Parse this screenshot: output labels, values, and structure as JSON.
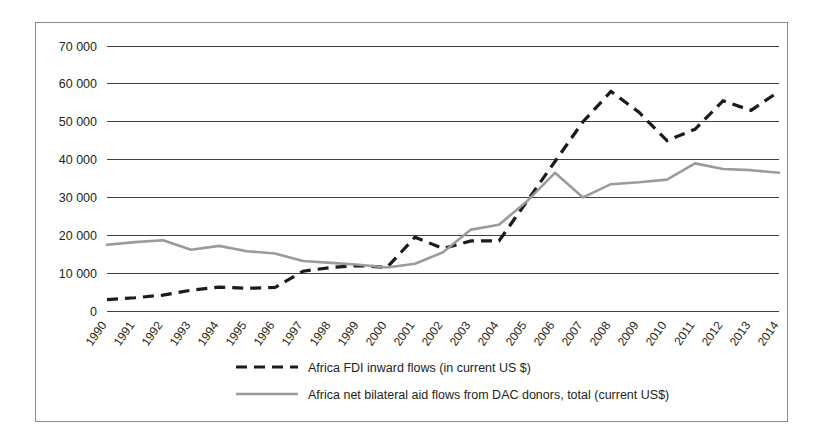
{
  "chart_data": {
    "type": "line",
    "title": "",
    "subtitle": "",
    "xlabel": "",
    "ylabel": "",
    "grid": true,
    "legend_position": "bottom",
    "ylim": [
      0,
      75000
    ],
    "y_ticks": [
      0,
      10000,
      20000,
      30000,
      40000,
      50000,
      60000,
      70000
    ],
    "y_tick_labels": [
      "0",
      "10 000",
      "20 000",
      "30 000",
      "40 000",
      "50 000",
      "60 000",
      "70 000"
    ],
    "categories": [
      "1990",
      "1991",
      "1992",
      "1993",
      "1994",
      "1995",
      "1996",
      "1997",
      "1998",
      "1999",
      "2000",
      "2001",
      "2002",
      "2003",
      "2004",
      "2005",
      "2006",
      "2007",
      "2008",
      "2009",
      "2010",
      "2011",
      "2012",
      "2013",
      "2014"
    ],
    "series": [
      {
        "name": "Africa FDI inward flows (in current US $)",
        "style": "dashed",
        "color": "#1b1b1b",
        "values": [
          3000,
          3500,
          4200,
          5500,
          6300,
          6000,
          6200,
          10500,
          11500,
          12000,
          11500,
          19500,
          16500,
          18500,
          18500,
          29000,
          39500,
          50000,
          58000,
          52500,
          45000,
          48000,
          55500,
          53000,
          58000
        ]
      },
      {
        "name": "Africa net bilateral aid flows from DAC donors, total (current US$)",
        "style": "solid",
        "color": "#9b9b9b",
        "values": [
          17500,
          18200,
          18700,
          16200,
          17200,
          15800,
          15200,
          13200,
          12700,
          12200,
          11500,
          12500,
          15500,
          21500,
          22800,
          29000,
          36500,
          30000,
          33500,
          34000,
          34700,
          39000,
          37500,
          37200,
          36500
        ]
      }
    ],
    "legend": [
      {
        "label": "Africa FDI inward flows (in current US $)",
        "style": "dashed",
        "color": "#1b1b1b"
      },
      {
        "label": "Africa net bilateral aid flows from DAC donors, total (current US$)",
        "style": "solid",
        "color": "#9b9b9b"
      }
    ]
  }
}
